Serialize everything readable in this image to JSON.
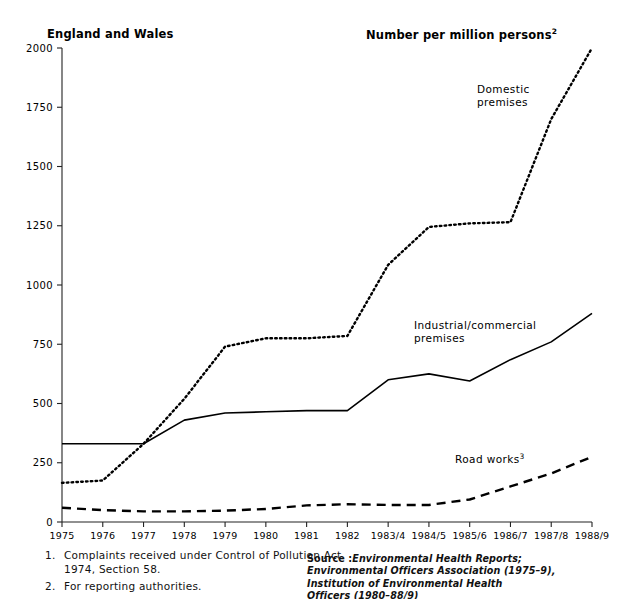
{
  "header": {
    "left_caption": "England and Wales",
    "right_caption": "Number per million persons",
    "right_caption_note": "2"
  },
  "footnotes": [
    {
      "num": "1.",
      "text": "Complaints received under Control of Pollution Act 1974, Section 58."
    },
    {
      "num": "2.",
      "text": "For reporting authorities."
    },
    {
      "num": "3.",
      "text": "Includes construction and demolition."
    }
  ],
  "source": {
    "lead": "Source :",
    "line1": "Environmental Health Reports;",
    "line2": "Environmental Officers Association (1975–9),",
    "line3": "Institution of Environmental Health",
    "line4": "Officers (1980–88/9)"
  },
  "annotations": {
    "domestic_line1": "Domestic",
    "domestic_line2": "premises",
    "industrial_line1": "Industrial/commercial",
    "industrial_line2": "premises",
    "roadworks": "Road works",
    "roadworks_note": "3"
  },
  "chart_data": {
    "type": "line",
    "title": "",
    "xlabel": "",
    "ylabel": "Number per million persons",
    "ylim": [
      0,
      2000
    ],
    "yticks": [
      0,
      250,
      500,
      750,
      1000,
      1250,
      1500,
      1750,
      2000
    ],
    "ytick_labels": [
      "0",
      "250",
      "500",
      "750",
      "1000",
      "1250",
      "1500",
      "1750",
      "2000"
    ],
    "grid": false,
    "legend": "inline-annotations",
    "categories": [
      "1975",
      "1976",
      "1977",
      "1978",
      "1979",
      "1980",
      "1981",
      "1982",
      "1983/4",
      "1984/5",
      "1985/6",
      "1986/7",
      "1987/8",
      "1988/9"
    ],
    "series": [
      {
        "name": "Domestic premises",
        "style": "dotted",
        "color": "#000000",
        "values": [
          165,
          175,
          330,
          520,
          740,
          775,
          775,
          785,
          1085,
          1245,
          1260,
          1265,
          1700,
          2000
        ]
      },
      {
        "name": "Industrial/commercial premises",
        "style": "solid",
        "color": "#000000",
        "values": [
          330,
          330,
          330,
          430,
          460,
          465,
          470,
          470,
          600,
          625,
          595,
          685,
          760,
          880
        ]
      },
      {
        "name": "Road works",
        "style": "dashed",
        "color": "#000000",
        "values": [
          60,
          50,
          45,
          45,
          48,
          55,
          70,
          75,
          72,
          72,
          95,
          150,
          205,
          275
        ]
      }
    ]
  }
}
